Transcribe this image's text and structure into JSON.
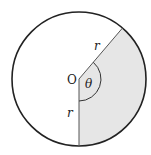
{
  "diagram": {
    "type": "circle-sector",
    "center_label": "O",
    "angle_label": "θ",
    "radius_label_upper": "r",
    "radius_label_lower": "r",
    "shaded_region": "sector between radius to lower point and radius to upper-right point",
    "colors": {
      "outline": "#222222",
      "sector_fill": "#e6e6e6",
      "background": "#ffffff"
    }
  }
}
